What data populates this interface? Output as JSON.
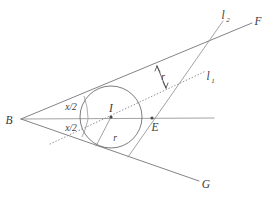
{
  "figure": {
    "type": "geometry-diagram",
    "background_color": "#ffffff",
    "line_color": "#6e6e70",
    "label_color": "#3a3a3c"
  },
  "labels": {
    "vertex_b": "B",
    "ray_f": "F",
    "ray_g": "G",
    "center_i": "I",
    "point_e": "E",
    "line_l1": "l",
    "line_l1_sub": "1",
    "line_l2": "l",
    "line_l2_sub": "2",
    "angle_upper": "x/2",
    "angle_lower": "x/2",
    "radius_upper": "r",
    "radius_lower": "r"
  },
  "geometry": {
    "vertex_b": {
      "x": 21,
      "y": 119
    },
    "center_i": {
      "x": 111,
      "y": 117
    },
    "point_e": {
      "x": 152,
      "y": 118
    },
    "circle_radius": 31,
    "ray_bf_end": {
      "x": 250,
      "y": 24
    },
    "ray_bg_end": {
      "x": 198,
      "y": 180
    },
    "bisector_end": {
      "x": 213,
      "y": 118
    },
    "l1_start": {
      "x": 51,
      "y": 143
    },
    "l1_end": {
      "x": 205,
      "y": 72
    },
    "l2_top": {
      "x": 222,
      "y": 22
    },
    "l2_bottom": {
      "x": 129,
      "y": 157
    },
    "tangent_upper": {
      "x": 98,
      "y": 87
    },
    "tangent_lower": {
      "x": 96,
      "y": 146
    }
  },
  "annotations": {
    "arrow_pair_label": "r",
    "radius_segment_label": "r"
  }
}
